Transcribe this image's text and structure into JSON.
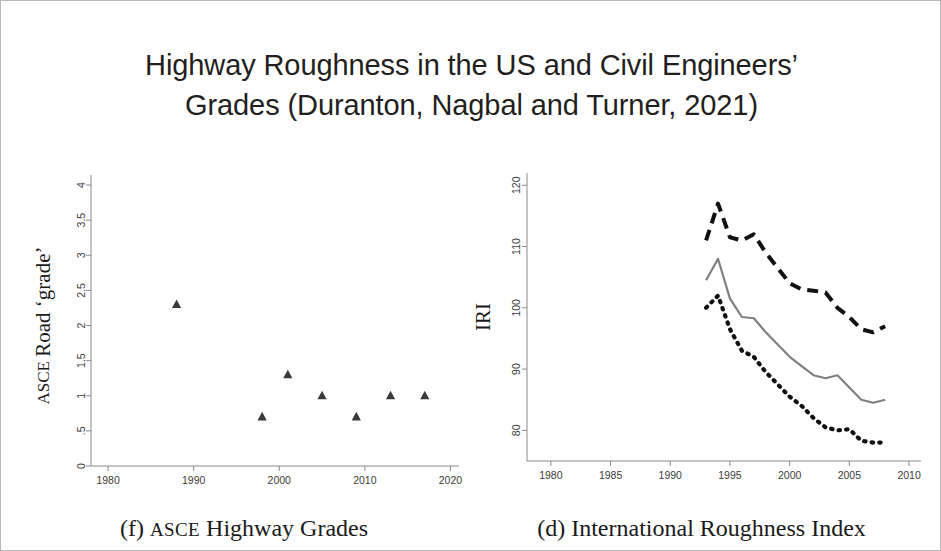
{
  "slide": {
    "title_line1": "Highway Roughness in the US and Civil Engineers’",
    "title_line2": "Grades (Duranton, Nagbal and Turner, 2021)",
    "background_color": "#ffffff",
    "border_color": "#b9b9b9"
  },
  "chart_data": [
    {
      "id": "asce-grades",
      "type": "scatter",
      "title": "",
      "caption_prefix": "(f)",
      "caption_smallcaps": "ASCE",
      "caption_suffix": "Highway Grades",
      "xlabel": "",
      "ylabel_smallcaps": "ASCE",
      "ylabel_rest": "Road ‘grade’",
      "xlim": [
        1978,
        2021
      ],
      "ylim": [
        0,
        4
      ],
      "xticks": [
        1980,
        1990,
        2000,
        2010,
        2020
      ],
      "xticklabels": [
        "1980",
        "1990",
        "2000",
        "2010",
        "2020"
      ],
      "yticks": [
        0,
        0.5,
        1,
        1.5,
        2,
        2.5,
        3,
        3.5,
        4
      ],
      "yticklabels": [
        "0",
        ".5",
        "1",
        "1.5",
        "2",
        "2.5",
        "3",
        "3.5",
        "4"
      ],
      "grid": false,
      "marker": "triangle",
      "marker_color": "#3a3a3a",
      "points": [
        {
          "x": 1988,
          "y": 2.3
        },
        {
          "x": 1998,
          "y": 0.7
        },
        {
          "x": 2001,
          "y": 1.3
        },
        {
          "x": 2005,
          "y": 1.0
        },
        {
          "x": 2009,
          "y": 0.7
        },
        {
          "x": 2013,
          "y": 1.0
        },
        {
          "x": 2017,
          "y": 1.0
        }
      ]
    },
    {
      "id": "international-roughness-index",
      "type": "line",
      "title": "",
      "caption_prefix": "(d)",
      "caption_suffix": "International Roughness Index",
      "xlabel": "",
      "ylabel": "IRI",
      "xlim": [
        1978,
        2011
      ],
      "ylim": [
        75,
        122
      ],
      "xticks": [
        1980,
        1985,
        1990,
        1995,
        2000,
        2005,
        2010
      ],
      "xticklabels": [
        "1980",
        "1985",
        "1990",
        "1995",
        "2000",
        "2005",
        "2010"
      ],
      "yticks": [
        80,
        90,
        100,
        110,
        120
      ],
      "yticklabels": [
        "80",
        "90",
        "100",
        "110",
        "120"
      ],
      "grid": false,
      "x": [
        1993,
        1994,
        1995,
        1996,
        1997,
        1998,
        1999,
        2000,
        2001,
        2002,
        2003,
        2004,
        2005,
        2006,
        2007,
        2008
      ],
      "series": [
        {
          "name": "upper",
          "style": "dashed",
          "color": "#111111",
          "values": [
            111.0,
            117.0,
            111.5,
            111.0,
            112.0,
            109.0,
            106.5,
            104.0,
            103.0,
            102.8,
            102.5,
            100.0,
            98.5,
            96.5,
            96.0,
            97.0
          ]
        },
        {
          "name": "middle",
          "style": "solid",
          "color": "#808080",
          "values": [
            104.5,
            108.0,
            101.5,
            98.5,
            98.3,
            96.0,
            94.0,
            92.0,
            90.5,
            89.0,
            88.5,
            89.0,
            87.0,
            85.0,
            84.5,
            85.0
          ]
        },
        {
          "name": "lower",
          "style": "dotted",
          "color": "#111111",
          "values": [
            100.0,
            102.0,
            96.5,
            93.0,
            92.0,
            89.5,
            87.5,
            85.5,
            84.0,
            82.0,
            80.5,
            80.0,
            80.2,
            78.3,
            78.0,
            78.0
          ]
        }
      ]
    }
  ]
}
